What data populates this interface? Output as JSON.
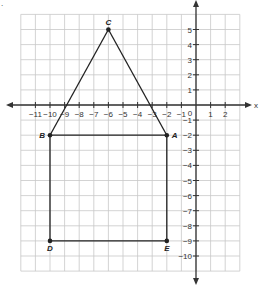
{
  "diagram": {
    "type": "coordinate-plane",
    "corner_mark": ".",
    "x_axis_label": "x",
    "y_axis_label": "y",
    "origin_label": "0",
    "grid": {
      "x_min": -12,
      "x_max": 3,
      "y_min": -11,
      "y_max": 6
    },
    "x_ticks": [
      "-11",
      "-10",
      "-9",
      "-8",
      "-7",
      "-6",
      "-5",
      "-4",
      "-3",
      "-2",
      "-1",
      "1",
      "2"
    ],
    "y_ticks": [
      "5",
      "4",
      "3",
      "2",
      "1",
      "-1",
      "-2",
      "-3",
      "-4",
      "-5",
      "-6",
      "-7",
      "-8",
      "-9",
      "-10"
    ],
    "points": [
      {
        "label": "A",
        "x": -2,
        "y": -2
      },
      {
        "label": "B",
        "x": -10,
        "y": -2
      },
      {
        "label": "C",
        "x": -6,
        "y": 5
      },
      {
        "label": "D",
        "x": -10,
        "y": -9
      },
      {
        "label": "E",
        "x": -2,
        "y": -9
      }
    ],
    "segments": [
      [
        "B",
        "C"
      ],
      [
        "C",
        "A"
      ],
      [
        "B",
        "A"
      ],
      [
        "B",
        "D"
      ],
      [
        "D",
        "E"
      ],
      [
        "E",
        "A"
      ]
    ],
    "colors": {
      "grid": "#c8c8c8",
      "axis": "#333333",
      "shape": "#222222"
    }
  }
}
